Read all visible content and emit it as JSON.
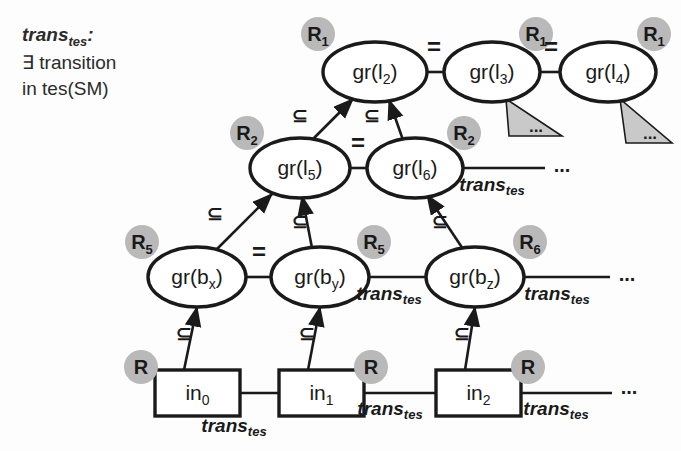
{
  "figure": {
    "background_color": "#fdfdfd",
    "stroke_color": "#1a1a1a",
    "badge_fill": "#b9b9b9",
    "badge_text_color": "#1a1a1a",
    "triangle_fill": "#c9c9c9"
  },
  "legend": {
    "term": "trans",
    "term_sub": "tes",
    "colon": ":",
    "line2": "∃ transition",
    "line3": "in tes(SM)"
  },
  "nodes": {
    "row_top": [
      {
        "id": "l2",
        "label": "gr(l",
        "sub": "2",
        "label_end": ")",
        "badge": "R",
        "badge_sub": "1",
        "shape": "ellipse",
        "cx": 375,
        "cy": 72,
        "rx": 52,
        "ry": 30,
        "badge_x": 318,
        "badge_y": 34
      },
      {
        "id": "l3",
        "label": "gr(l",
        "sub": "3",
        "label_end": ")",
        "badge": "R",
        "badge_sub": "1",
        "shape": "ellipse",
        "cx": 492,
        "cy": 72,
        "rx": 48,
        "ry": 30,
        "badge_x": 536,
        "badge_y": 34
      },
      {
        "id": "l4",
        "label": "gr(l",
        "sub": "4",
        "label_end": ")",
        "badge": "R",
        "badge_sub": "1",
        "shape": "ellipse",
        "cx": 608,
        "cy": 72,
        "rx": 48,
        "ry": 30,
        "badge_x": 654,
        "badge_y": 34
      }
    ],
    "row_two": [
      {
        "id": "l5",
        "label": "gr(l",
        "sub": "5",
        "label_end": ")",
        "badge": "R",
        "badge_sub": "2",
        "shape": "ellipse",
        "cx": 300,
        "cy": 168,
        "rx": 50,
        "ry": 30,
        "badge_x": 247,
        "badge_y": 133
      },
      {
        "id": "l6",
        "label": "gr(l",
        "sub": "6",
        "label_end": ")",
        "badge": "R",
        "badge_sub": "2",
        "shape": "ellipse",
        "cx": 415,
        "cy": 168,
        "rx": 48,
        "ry": 30,
        "badge_x": 464,
        "badge_y": 133
      }
    ],
    "row_three": [
      {
        "id": "bx",
        "label": "gr(b",
        "sub": "x",
        "label_end": ")",
        "badge": "R",
        "badge_sub": "5",
        "shape": "ellipse",
        "cx": 197,
        "cy": 277,
        "rx": 49,
        "ry": 30,
        "badge_x": 142,
        "badge_y": 242
      },
      {
        "id": "by",
        "label": "gr(b",
        "sub": "y",
        "label_end": ")",
        "badge": "R",
        "badge_sub": "5",
        "shape": "ellipse",
        "cx": 320,
        "cy": 277,
        "rx": 49,
        "ry": 30,
        "badge_x": 374,
        "badge_y": 242
      },
      {
        "id": "bz",
        "label": "gr(b",
        "sub": "z",
        "label_end": ")",
        "badge": "R",
        "badge_sub": "6",
        "shape": "ellipse",
        "cx": 475,
        "cy": 277,
        "rx": 49,
        "ry": 30,
        "badge_x": 530,
        "badge_y": 242
      }
    ],
    "row_bottom": [
      {
        "id": "in0",
        "label": "in",
        "sub": "0",
        "label_end": "",
        "badge": "R",
        "badge_sub": "",
        "shape": "rect",
        "x": 155,
        "y": 370,
        "w": 85,
        "h": 46,
        "badge_x": 141,
        "badge_y": 367
      },
      {
        "id": "in1",
        "label": "in",
        "sub": "1",
        "label_end": "",
        "badge": "R",
        "badge_sub": "",
        "shape": "rect",
        "x": 279,
        "y": 370,
        "w": 85,
        "h": 46,
        "badge_x": 371,
        "badge_y": 367
      },
      {
        "id": "in2",
        "label": "in",
        "sub": "2",
        "label_end": "",
        "badge": "R",
        "badge_sub": "",
        "shape": "rect",
        "x": 436,
        "y": 370,
        "w": 85,
        "h": 46,
        "badge_x": 528,
        "badge_y": 367
      }
    ]
  },
  "edge_labels": {
    "equals": "=",
    "subset": "⊆",
    "trans": "trans",
    "trans_sub": "tes",
    "ellipsis": "..."
  },
  "equals_links": [
    {
      "id": "l2-l3",
      "x": 434,
      "y": 55
    },
    {
      "id": "l3-l4",
      "x": 551,
      "y": 55
    },
    {
      "id": "l5-l6",
      "x": 358,
      "y": 151
    },
    {
      "id": "bx-by",
      "x": 259,
      "y": 260
    }
  ],
  "subset_links": [
    {
      "id": "l5-to-l2",
      "x": 300,
      "y": 122
    },
    {
      "id": "l6-to-l2",
      "x": 372,
      "y": 122
    },
    {
      "id": "bx-to-l5",
      "x": 215,
      "y": 220
    },
    {
      "id": "by-to-l5",
      "x": 300,
      "y": 228
    },
    {
      "id": "bz-to-l6",
      "x": 440,
      "y": 228
    },
    {
      "id": "in0-to-bx",
      "x": 184,
      "y": 340
    },
    {
      "id": "in1-to-by",
      "x": 307,
      "y": 340
    },
    {
      "id": "in2-to-bz",
      "x": 462,
      "y": 340
    }
  ],
  "trans_links": [
    {
      "id": "l6-right",
      "label_x": 492,
      "label_y": 191,
      "ellipsis_x": 562,
      "ellipsis_y": 172
    },
    {
      "id": "by-bz-gap",
      "label_x": 389,
      "label_y": 300,
      "ellipsis_x": null,
      "ellipsis_y": null
    },
    {
      "id": "bz-right",
      "label_x": 557,
      "label_y": 300,
      "ellipsis_x": 627,
      "ellipsis_y": 281
    },
    {
      "id": "in0-in1-gap",
      "label_x": 234,
      "label_y": 432,
      "ellipsis_x": null,
      "ellipsis_y": null
    },
    {
      "id": "in1-in2-gap",
      "label_x": 390,
      "label_y": 415,
      "ellipsis_x": null,
      "ellipsis_y": null
    },
    {
      "id": "in2-right",
      "label_x": 556,
      "label_y": 415,
      "ellipsis_x": 629,
      "ellipsis_y": 394
    }
  ],
  "triangles": [
    {
      "id": "under-l3",
      "label": "...",
      "apex_x": 506,
      "apex_y": 99,
      "left_x": 509,
      "left_y": 136,
      "right_x": 562,
      "right_y": 136,
      "dots_x": 536,
      "dots_y": 132
    },
    {
      "id": "under-l4",
      "label": "...",
      "apex_x": 620,
      "apex_y": 99,
      "left_x": 626,
      "left_y": 143,
      "right_x": 672,
      "right_y": 143,
      "dots_x": 650,
      "dots_y": 139
    }
  ]
}
